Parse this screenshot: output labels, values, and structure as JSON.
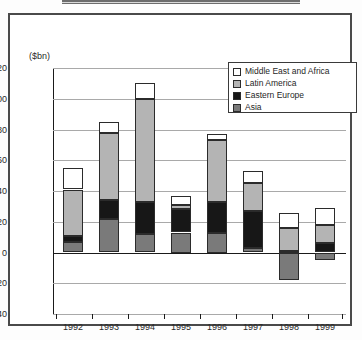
{
  "figure": {
    "unit_label": "($bn)",
    "top_rule": "decorative-rule"
  },
  "legend": {
    "position": "top-right-inside-plot",
    "items": [
      {
        "label": "Middle East and Africa",
        "color": "#ffffff",
        "key": "mea"
      },
      {
        "label": "Latin America",
        "color": "#b4b4b4",
        "key": "latam"
      },
      {
        "label": "Eastern Europe",
        "color": "#171717",
        "key": "ee"
      },
      {
        "label": "Asia",
        "color": "#7a7a7a",
        "key": "asia"
      }
    ]
  },
  "yaxis": {
    "ticks": [
      "120",
      "100",
      "80",
      "60",
      "40",
      "20",
      "0",
      "-20",
      "-40"
    ],
    "values": [
      120,
      100,
      80,
      60,
      40,
      20,
      0,
      -20,
      -40
    ],
    "min": -40,
    "max": 120
  },
  "xaxis": {
    "labels": [
      "1992",
      "1993",
      "1994",
      "1995",
      "1996",
      "1997",
      "1998",
      "1999"
    ]
  },
  "chart_data": {
    "type": "bar",
    "stacked": true,
    "title": "",
    "xlabel": "",
    "ylabel": "($bn)",
    "ylim": [
      -40,
      120
    ],
    "grid": true,
    "legend_position": "top-right",
    "categories": [
      "1992",
      "1993",
      "1994",
      "1995",
      "1996",
      "1997",
      "1998",
      "1999"
    ],
    "series": [
      {
        "name": "Asia",
        "color": "#7a7a7a",
        "values": [
          7,
          22,
          12,
          13,
          13,
          3,
          -18,
          -5
        ]
      },
      {
        "name": "Eastern Europe",
        "color": "#171717",
        "values": [
          4,
          12,
          21,
          15,
          20,
          24,
          1,
          11
        ]
      },
      {
        "name": "Latin America",
        "color": "#b4b4b4",
        "values": [
          30,
          44,
          67,
          3,
          40,
          18,
          15,
          12
        ]
      },
      {
        "name": "Middle East and Africa",
        "color": "#ffffff",
        "values": [
          14,
          7,
          10,
          6,
          4,
          8,
          10,
          11
        ]
      }
    ],
    "totals": [
      55,
      85,
      110,
      37,
      77,
      53,
      26,
      29
    ]
  },
  "bars": [
    {
      "year": "1992",
      "x": 10,
      "segments": [
        {
          "key": "mea",
          "from": 41,
          "to": 55
        },
        {
          "key": "latam",
          "from": 11,
          "to": 41
        },
        {
          "key": "ee",
          "from": 7,
          "to": 11
        },
        {
          "key": "asia",
          "from": 0,
          "to": 7
        }
      ]
    },
    {
      "year": "1993",
      "x": 46,
      "segments": [
        {
          "key": "mea",
          "from": 78,
          "to": 85
        },
        {
          "key": "latam",
          "from": 34,
          "to": 78
        },
        {
          "key": "ee",
          "from": 22,
          "to": 34
        },
        {
          "key": "asia",
          "from": 0,
          "to": 22
        }
      ]
    },
    {
      "year": "1994",
      "x": 82,
      "segments": [
        {
          "key": "mea",
          "from": 100,
          "to": 110
        },
        {
          "key": "latam",
          "from": 33,
          "to": 100
        },
        {
          "key": "ee",
          "from": 12,
          "to": 33
        },
        {
          "key": "asia",
          "from": 0,
          "to": 12
        }
      ]
    },
    {
      "year": "1995",
      "x": 118,
      "segments": [
        {
          "key": "mea",
          "from": 31,
          "to": 37
        },
        {
          "key": "latam",
          "from": 28,
          "to": 31
        },
        {
          "key": "ee",
          "from": 13,
          "to": 28
        },
        {
          "key": "asia",
          "from": 0,
          "to": 13
        }
      ]
    },
    {
      "year": "1996",
      "x": 154,
      "segments": [
        {
          "key": "mea",
          "from": 73,
          "to": 77
        },
        {
          "key": "latam",
          "from": 33,
          "to": 73
        },
        {
          "key": "ee",
          "from": 13,
          "to": 33
        },
        {
          "key": "asia",
          "from": 0,
          "to": 13
        }
      ]
    },
    {
      "year": "1997",
      "x": 190,
      "segments": [
        {
          "key": "mea",
          "from": 45,
          "to": 53
        },
        {
          "key": "latam",
          "from": 27,
          "to": 45
        },
        {
          "key": "ee",
          "from": 3,
          "to": 27
        },
        {
          "key": "asia",
          "from": 0,
          "to": 3
        }
      ]
    },
    {
      "year": "1998",
      "x": 226,
      "segments": [
        {
          "key": "mea",
          "from": 16,
          "to": 26
        },
        {
          "key": "latam",
          "from": 1,
          "to": 16
        },
        {
          "key": "ee",
          "from": 0,
          "to": 1
        },
        {
          "key": "asia",
          "from": -18,
          "to": 0
        }
      ]
    },
    {
      "year": "1999",
      "x": 262,
      "segments": [
        {
          "key": "mea",
          "from": 18,
          "to": 29
        },
        {
          "key": "latam",
          "from": 6,
          "to": 18
        },
        {
          "key": "ee",
          "from": 0,
          "to": 6
        },
        {
          "key": "asia",
          "from": -5,
          "to": 0
        }
      ]
    }
  ]
}
